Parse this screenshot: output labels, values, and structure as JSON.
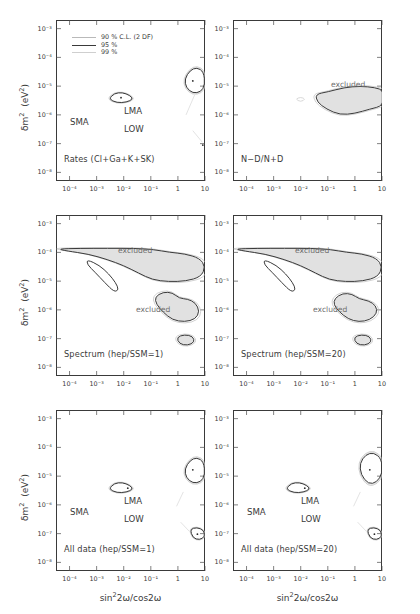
{
  "figure": {
    "suptitle": "",
    "axis": {
      "xlabel": "sin²2ω/cos2ω",
      "ylabel": "δm²  (eV²)",
      "xticks": [
        "10⁻⁴",
        "10⁻³",
        "10⁻²",
        "10⁻¹",
        "1",
        "10"
      ],
      "yticks": [
        "10⁻³",
        "10⁻⁴",
        "10⁻⁵",
        "10⁻⁶",
        "10⁻⁷",
        "10⁻⁸"
      ],
      "xlim_log": [
        -4.5,
        1.0
      ],
      "ylim_log": [
        -8.3,
        -2.7
      ]
    },
    "legend": {
      "items": [
        {
          "label": "90 % C.L.  (2 DF)",
          "style": "sw90",
          "color": "#b9b9b9"
        },
        {
          "label": "95 %",
          "style": "sw95",
          "color": "#3a3a3a"
        },
        {
          "label": "99 %",
          "style": "sw99",
          "color": "#cfcfcf"
        }
      ]
    },
    "region_labels": {
      "sma": "SMA",
      "lma": "LMA",
      "low": "LOW",
      "excluded": "excluded"
    },
    "panels": [
      {
        "id": "rates",
        "label": "Rates (Cl+Ga+K+SK)",
        "kind": "allowed",
        "has_legend": true
      },
      {
        "id": "nd-ratio",
        "label": "N−D/N+D",
        "kind": "excluded",
        "has_legend": false
      },
      {
        "id": "spectrum-1",
        "label": "Spectrum (hep/SSM=1)",
        "kind": "excluded",
        "has_legend": false
      },
      {
        "id": "spectrum-20",
        "label": "Spectrum (hep/SSM=20)",
        "kind": "excluded",
        "has_legend": false
      },
      {
        "id": "alldata-1",
        "label": "All data (hep/SSM=1)",
        "kind": "allowed",
        "has_legend": false
      },
      {
        "id": "alldata-20",
        "label": "All data (hep/SSM=20)",
        "kind": "allowed",
        "has_legend": false
      }
    ]
  },
  "chart_data": {
    "type": "scatter",
    "xlabel": "sin²2ω/cos2ω",
    "ylabel": "δm² (eV²)",
    "xscale": "log",
    "yscale": "log",
    "xlim": [
      3.16e-05,
      10
    ],
    "ylim": [
      1e-08,
      0.001
    ],
    "grid": false,
    "legend_position": "upper-left of first panel",
    "confidence_levels": [
      "90 % C.L. (2 DF)",
      "95 %",
      "99 %"
    ],
    "solution_regions": [
      "SMA",
      "LMA",
      "LOW"
    ],
    "panels": [
      {
        "name": "Rates (Cl+Ga+K+SK)",
        "meaning": "allowed regions",
        "best_fit_points": [
          {
            "region": "SMA",
            "x": 0.005,
            "y": 5e-06
          },
          {
            "region": "LMA",
            "x": 2.5,
            "y": 2e-05
          },
          {
            "region": "LOW",
            "x": 3.0,
            "y": 8e-08
          }
        ]
      },
      {
        "name": "N−D/N+D",
        "meaning": "excluded region",
        "excluded_centroid": {
          "x": 1.0,
          "y": 2.5e-06
        }
      },
      {
        "name": "Spectrum (hep/SSM=1)",
        "meaning": "excluded regions",
        "excluded_centroids": [
          {
            "x": 0.1,
            "y": 5e-05
          },
          {
            "x": 0.8,
            "y": 1e-06
          },
          {
            "x": 0.7,
            "y": 1e-07
          }
        ]
      },
      {
        "name": "Spectrum (hep/SSM=20)",
        "meaning": "excluded regions",
        "excluded_centroids": [
          {
            "x": 0.1,
            "y": 5e-05
          },
          {
            "x": 0.8,
            "y": 1.2e-06
          },
          {
            "x": 0.7,
            "y": 1e-07
          }
        ]
      },
      {
        "name": "All data (hep/SSM=1)",
        "meaning": "allowed regions",
        "best_fit_points": [
          {
            "region": "SMA",
            "x": 0.005,
            "y": 4.5e-06
          },
          {
            "region": "LMA",
            "x": 2.5,
            "y": 2.2e-05
          },
          {
            "region": "LOW",
            "x": 3.5,
            "y": 1.1e-07
          }
        ]
      },
      {
        "name": "All data (hep/SSM=20)",
        "meaning": "allowed regions",
        "best_fit_points": [
          {
            "region": "SMA",
            "x": 0.005,
            "y": 4.5e-06
          },
          {
            "region": "LMA",
            "x": 3.0,
            "y": 2e-05
          },
          {
            "region": "LOW",
            "x": 4.0,
            "y": 1.1e-07
          }
        ]
      }
    ]
  }
}
